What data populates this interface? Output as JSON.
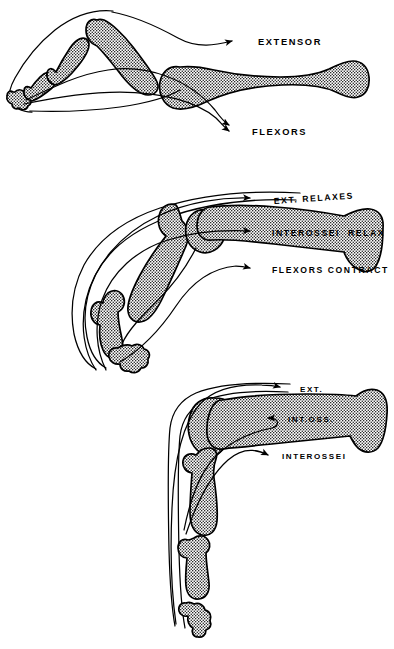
{
  "figure": {
    "ink_color": "#000000",
    "background_color": "#ffffff",
    "panel_count": 3
  },
  "panels": [
    {
      "id": "panel-extended",
      "position_name": "extended",
      "labels": [
        {
          "id": "extensor",
          "text": "EXTENSOR",
          "size": "lg",
          "x": 258,
          "y": 45
        },
        {
          "id": "flexors",
          "text": "FLEXORS",
          "size": "lg",
          "x": 252,
          "y": 133
        }
      ],
      "arrows": [
        {
          "id": "arrow-extensor",
          "tip_x": 252,
          "tip_y": 41
        },
        {
          "id": "arrow-flexors-upper",
          "tip_x": 248,
          "tip_y": 126
        },
        {
          "id": "arrow-flexors-lower",
          "tip_x": 248,
          "tip_y": 132
        }
      ]
    },
    {
      "id": "panel-flexed",
      "position_name": "flexed-claw",
      "labels": [
        {
          "id": "ext-relaxes",
          "text": "EXT. RELAXES",
          "size": "md",
          "x": 274,
          "y": 203
        },
        {
          "id": "interossei-relax",
          "text": "INTEROSSEI  RELAX",
          "size": "md",
          "x": 272,
          "y": 235
        },
        {
          "id": "flexors-contract",
          "text": "FLEXORS CONTRACT",
          "size": "md",
          "x": 272,
          "y": 272
        }
      ],
      "arrows": [
        {
          "id": "arrow-ext-relaxes",
          "tip_x": 267,
          "tip_y": 200
        },
        {
          "id": "arrow-interossei-relax",
          "tip_x": 266,
          "tip_y": 232
        },
        {
          "id": "arrow-flexors-contract",
          "tip_x": 266,
          "tip_y": 269
        }
      ]
    },
    {
      "id": "panel-intrinsic-plus",
      "position_name": "intrinsic-plus",
      "labels": [
        {
          "id": "ext",
          "text": "EXT.",
          "size": "sm",
          "x": 300,
          "y": 391
        },
        {
          "id": "int-oss",
          "text": "INT.OSS.",
          "size": "sm",
          "x": 288,
          "y": 421
        },
        {
          "id": "interossei",
          "text": "INTEROSSEI",
          "size": "sm",
          "x": 282,
          "y": 458
        }
      ],
      "arrows": [
        {
          "id": "arrow-ext",
          "tip_x": 294,
          "tip_y": 388
        },
        {
          "id": "arrow-int-oss",
          "tip_x": 282,
          "tip_y": 418
        },
        {
          "id": "arrow-interossei",
          "tip_x": 276,
          "tip_y": 455
        }
      ]
    }
  ],
  "page_mark": {
    "text": ""
  }
}
